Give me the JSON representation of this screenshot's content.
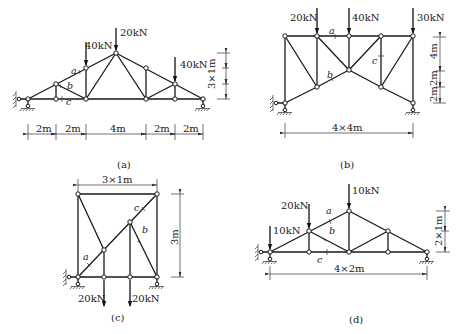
{
  "figures": [
    {
      "id": "a",
      "caption": "(a)",
      "loads": [
        "20kN",
        "40kN",
        "40kN"
      ],
      "member_labels": [
        "a",
        "b",
        "c"
      ],
      "dimensions": {
        "horizontal": [
          "2m",
          "2m",
          "4m",
          "2m",
          "2m"
        ],
        "vertical": "3×1m"
      }
    },
    {
      "id": "b",
      "caption": "(b)",
      "loads": [
        "20kN",
        "40kN",
        "30kN"
      ],
      "member_labels": [
        "a",
        "b",
        "c"
      ],
      "dimensions": {
        "horizontal": "4×4m",
        "vertical": [
          "4m",
          "2m",
          "2m"
        ]
      }
    },
    {
      "id": "c",
      "caption": "(c)",
      "loads": [
        "20kN",
        "20kN"
      ],
      "member_labels": [
        "a",
        "b",
        "c"
      ],
      "dimensions": {
        "horizontal": "3×1m",
        "vertical": "3m"
      }
    },
    {
      "id": "d",
      "caption": "(d)",
      "loads": [
        "10kN",
        "20kN",
        "10kN"
      ],
      "member_labels": [
        "a",
        "b",
        "c"
      ],
      "dimensions": {
        "horizontal": "4×2m",
        "vertical": "2×1m"
      }
    }
  ]
}
